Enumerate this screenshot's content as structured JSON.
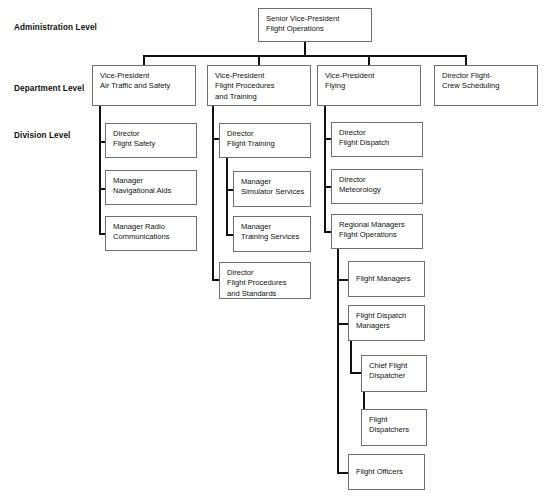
{
  "chart": {
    "type": "org-chart",
    "levels": [
      {
        "id": "administration",
        "label": "Administration Level"
      },
      {
        "id": "department",
        "label": "Department Level"
      },
      {
        "id": "division",
        "label": "Division Level"
      }
    ],
    "nodes": {
      "root": "Senior Vice-President\nFlight Operations",
      "dept1": "Vice-President\nAir Traffic and Safety",
      "dept2": "Vice-President\nFlight Procedures\nand Training",
      "dept3": "Vice-President\nFlying",
      "dept4": "Director Flight-\nCrew Scheduling",
      "c1a": "Director\nFlight Safety",
      "c1b": "Manager\nNavigational Aids",
      "c1c": "Manager Radio\nCommunications",
      "c2a": "Director\nFlight Training",
      "c2a1": "Manager\nSimulator Services",
      "c2a2": "Manager\nTraining Services",
      "c2b": "Director\nFlight Procedures\nand Standards",
      "c3a": "Director\nFlight Dispatch",
      "c3b": "Director\nMeteorology",
      "c3c": "Regional Managers\nFlight Operations",
      "c3c1": "Flight Managers",
      "c3c2": "Flight Dispatch\nManagers",
      "c3c2a": "Chief Flight\nDispatcher",
      "c3c2a1": "Flight\nDispatchers",
      "c3c3": "Flight Officers"
    }
  }
}
